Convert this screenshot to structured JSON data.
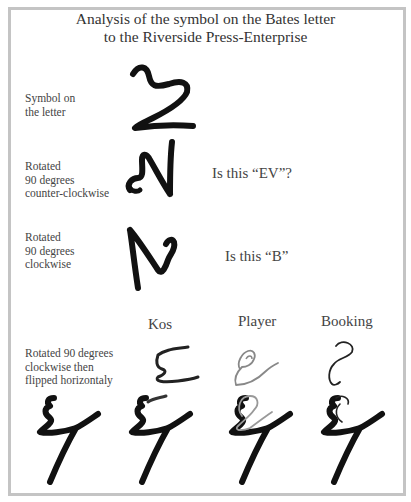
{
  "title": {
    "line1": "Analysis of the symbol on the Bates letter",
    "line2": "to the Riverside Press-Enterprise"
  },
  "rows": [
    {
      "label_lines": [
        "Symbol on",
        "the letter"
      ],
      "question": "",
      "image": "symbol-original"
    },
    {
      "label_lines": [
        "Rotated",
        "90 degrees",
        "counter-clockwise"
      ],
      "question": "Is this “EV”?",
      "image": "symbol-rotated-ccw"
    },
    {
      "label_lines": [
        "Rotated",
        "90 degrees",
        "clockwise"
      ],
      "question": "Is this “B”",
      "image": "symbol-rotated-cw"
    },
    {
      "label_lines": [
        "Rotated 90 degrees",
        "clockwise then",
        "flipped horizontaly"
      ],
      "question": "",
      "image": "symbol-rotated-flipped"
    }
  ],
  "comparison": {
    "columns": [
      "Kos",
      "Player",
      "Booking"
    ],
    "handwriting_samples": [
      "kos-signature",
      "player-signature",
      "booking-signature"
    ],
    "overlays": [
      "symbol-alone",
      "symbol-with-kos-overlay",
      "symbol-with-player-overlay",
      "symbol-with-booking-overlay"
    ]
  },
  "colors": {
    "frame": "#c4c4c4",
    "ink": "#111111",
    "overlay_gray": "#888888",
    "text": "#444444"
  }
}
